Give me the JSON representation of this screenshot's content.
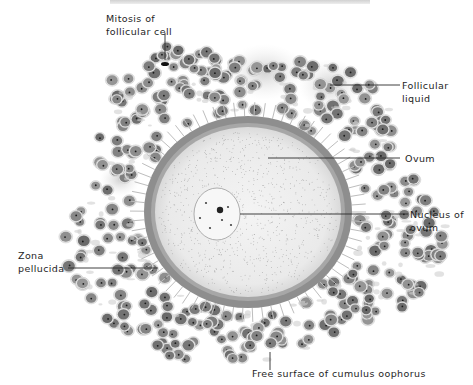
{
  "figure": {
    "labels": {
      "mitosis": [
        "Mitosis of",
        "follicular cell"
      ],
      "follicular_liquid": [
        "Follicular",
        "liquid"
      ],
      "ovum": [
        "Ovum"
      ],
      "nucleus": [
        "Nucleus of",
        "ovum"
      ],
      "zona": [
        "Zona",
        "pellucida"
      ],
      "free_surface": [
        "Free surface of cumulus oophorus"
      ]
    },
    "colors": {
      "text": "#1e1e1e",
      "leader_line": "#2a2a2a",
      "zona": "#8a8a8a",
      "ooplasm": "#eeeeee",
      "cell_body": "#b9b9b9",
      "cell_nucleus": "#5a5a5a",
      "liquid": "#d6d6d6"
    }
  }
}
